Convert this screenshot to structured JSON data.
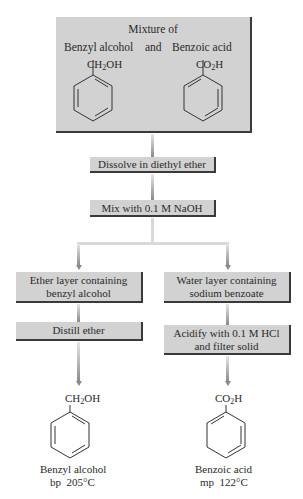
{
  "title_box": {
    "line1": "Mixture of",
    "compound1": "Benzyl alcohol",
    "conjunction": "and",
    "compound2": "Benzoic acid",
    "formula1_pre": "CH",
    "formula1_sub": "2",
    "formula1_post": "OH",
    "formula2_pre": "CO",
    "formula2_sub": "2",
    "formula2_post": "H"
  },
  "steps": {
    "dissolve": "Dissolve in diethyl ether",
    "mix": "Mix with 0.1 M NaOH"
  },
  "left_branch": {
    "layer_line1": "Ether layer containing",
    "layer_line2": "benzyl alcohol",
    "step": "Distill ether",
    "product_formula_pre": "CH",
    "product_formula_sub": "2",
    "product_formula_post": "OH",
    "product_name": "Benzyl alcohol",
    "product_property": "bp  205°C"
  },
  "right_branch": {
    "layer_line1": "Water layer containing",
    "layer_line2": "sodium benzoate",
    "step_line1": "Acidify with 0.1 M HCl",
    "step_line2": "and filter solid",
    "product_formula_pre": "CO",
    "product_formula_sub": "2",
    "product_formula_post": "H",
    "product_name": "Benzoic acid",
    "product_property": "mp  122°C"
  },
  "colors": {
    "box_fill": "#d2d2d2",
    "box_shadow": "#3a3a3a",
    "connector_light": "#e6e6e6",
    "connector_dark": "#8a8a8a"
  }
}
